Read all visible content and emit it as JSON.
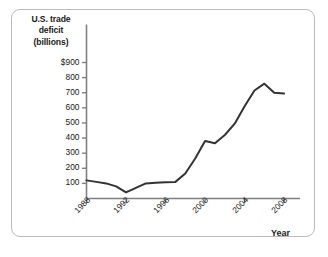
{
  "figure": {
    "background_color": "#ffffff",
    "frame_color": "#b9bcbe",
    "line_color": "#333333",
    "axis_color": "#808080",
    "text_color": "#1a1a1a"
  },
  "chart_data": {
    "type": "line",
    "title": "",
    "ylabel": "U.S. trade deficit (billions)",
    "ylabel_lines": [
      "U.S. trade",
      "deficit",
      "(billions)"
    ],
    "xlabel": "Year",
    "x": [
      1988,
      1989,
      1990,
      1991,
      1992,
      1993,
      1994,
      1995,
      1996,
      1997,
      1998,
      1999,
      2000,
      2001,
      2002,
      2003,
      2004,
      2005,
      2006,
      2007,
      2008
    ],
    "values": [
      120,
      110,
      100,
      80,
      40,
      70,
      100,
      105,
      108,
      110,
      165,
      265,
      380,
      365,
      420,
      495,
      610,
      715,
      760,
      700,
      695
    ],
    "series": [
      {
        "name": "U.S. trade deficit",
        "values": [
          120,
          110,
          100,
          80,
          40,
          70,
          100,
          105,
          108,
          110,
          165,
          265,
          380,
          365,
          420,
          495,
          610,
          715,
          760,
          700,
          695
        ]
      }
    ],
    "xticks": [
      1988,
      1992,
      1996,
      2000,
      2004,
      2008
    ],
    "xtick_labels": [
      "1988",
      "1992",
      "1996",
      "2000",
      "2004",
      "2008"
    ],
    "yticks": [
      100,
      200,
      300,
      400,
      500,
      600,
      700,
      800,
      900
    ],
    "ytick_labels": [
      "100",
      "200",
      "300",
      "400",
      "500",
      "600",
      "700",
      "800",
      "$900"
    ],
    "xlim": [
      1988,
      2009
    ],
    "ylim": [
      0,
      900
    ],
    "grid": false,
    "legend": null,
    "xtick_rotation": -45
  },
  "axis": {
    "y_title_line1": "U.S. trade",
    "y_title_line2": "deficit",
    "y_title_line3": "(billions)",
    "x_title": "Year"
  }
}
